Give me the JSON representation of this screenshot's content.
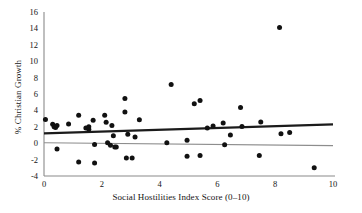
{
  "chart_data": {
    "type": "scatter",
    "title": "",
    "xlabel": "Social Hostilities Index Score (0–10)",
    "ylabel": "% Christian Growth",
    "xlim": [
      0,
      10
    ],
    "ylim": [
      -4,
      16
    ],
    "xticks": [
      0,
      2,
      4,
      6,
      8,
      10
    ],
    "yticks": [
      -4,
      -2,
      0,
      2,
      4,
      6,
      8,
      10,
      12,
      14,
      16
    ],
    "xtick_labels": [
      "0",
      "2",
      "4",
      "6",
      "8",
      "10"
    ],
    "ytick_labels": [
      "-4",
      "-2",
      "0",
      "2",
      "4",
      "6",
      "8",
      "10",
      "12",
      "14",
      "16"
    ],
    "grid": false,
    "legend": "none",
    "points": [
      [
        0.05,
        2.9
      ],
      [
        0.3,
        2.3
      ],
      [
        0.35,
        2.0
      ],
      [
        0.4,
        1.9
      ],
      [
        0.45,
        2.15
      ],
      [
        0.45,
        -0.7
      ],
      [
        0.85,
        2.35
      ],
      [
        1.2,
        3.4
      ],
      [
        1.2,
        -2.3
      ],
      [
        1.45,
        1.85
      ],
      [
        1.55,
        1.7
      ],
      [
        1.55,
        2.0
      ],
      [
        1.7,
        2.8
      ],
      [
        1.75,
        -0.15
      ],
      [
        1.75,
        -2.4
      ],
      [
        2.1,
        3.4
      ],
      [
        2.15,
        2.55
      ],
      [
        2.2,
        0.05
      ],
      [
        2.3,
        -0.25
      ],
      [
        2.35,
        2.15
      ],
      [
        2.4,
        0.9
      ],
      [
        2.45,
        -0.45
      ],
      [
        2.5,
        -0.45
      ],
      [
        2.8,
        5.45
      ],
      [
        2.8,
        3.8
      ],
      [
        2.85,
        -1.8
      ],
      [
        2.9,
        1.1
      ],
      [
        3.05,
        -1.8
      ],
      [
        3.15,
        0.75
      ],
      [
        3.3,
        2.85
      ],
      [
        4.25,
        0.05
      ],
      [
        4.4,
        7.15
      ],
      [
        4.95,
        0.35
      ],
      [
        4.95,
        -1.6
      ],
      [
        5.2,
        4.8
      ],
      [
        5.4,
        5.2
      ],
      [
        5.4,
        -1.5
      ],
      [
        5.65,
        1.85
      ],
      [
        5.85,
        2.1
      ],
      [
        6.2,
        2.45
      ],
      [
        6.25,
        -0.2
      ],
      [
        6.45,
        1.0
      ],
      [
        6.8,
        4.35
      ],
      [
        6.85,
        2.05
      ],
      [
        7.45,
        -1.5
      ],
      [
        7.5,
        2.6
      ],
      [
        8.15,
        14.1
      ],
      [
        8.2,
        1.15
      ],
      [
        8.5,
        1.3
      ],
      [
        9.35,
        -3.0
      ]
    ],
    "trend_line": {
      "name": "linear-fit",
      "x_start": 0,
      "y_start": 1.2,
      "x_end": 10,
      "y_end": 2.3,
      "color": "#1b1b1b"
    },
    "zero_line": {
      "name": "zero-reference",
      "x_start": 0,
      "y_start": 0.05,
      "x_end": 10,
      "y_end": -0.3,
      "color": "#8d8d8d"
    }
  }
}
